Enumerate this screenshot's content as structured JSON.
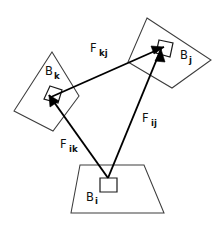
{
  "figure": {
    "background_color": "#ffffff",
    "line_color": "#3d3d3d",
    "arrow_color": "#000000",
    "text_color": "#111111",
    "width": 219,
    "height": 229
  },
  "bodies": [
    {
      "id": "B_i",
      "label_base": "B",
      "label_sub": "i",
      "shape": "trapezoid",
      "label_x": 86,
      "label_y": 201,
      "sub_x": 95,
      "sub_y": 204,
      "outline_points": "80,165 144,165 164,213 71,213",
      "anchor_shape": "square",
      "anchor_points": "100,178 117,178 117,192 100,192"
    },
    {
      "id": "B_j",
      "label_base": "B",
      "label_sub": "j",
      "shape": "quadrilateral",
      "label_x": 180,
      "label_y": 59,
      "sub_x": 189,
      "sub_y": 63,
      "outline_points": "147,18 211,60 172,88 128,62",
      "anchor_shape": "rotated-square",
      "anchor_points": "159,40 173,43 170,57 156,53"
    },
    {
      "id": "B_k",
      "label_base": "B",
      "label_sub": "k",
      "shape": "quadrilateral",
      "label_x": 45,
      "label_y": 75,
      "sub_x": 54,
      "sub_y": 79,
      "outline_points": "52,52 79,96 53,131 14,111",
      "anchor_shape": "rotated-square",
      "anchor_points": "50,86 62,90 58,103 44,99"
    }
  ],
  "forces": [
    {
      "id": "F_kj",
      "label_base": "F",
      "label_sub": "kj",
      "from_body": "B_k",
      "to_body": "B_j",
      "x1": 51,
      "y1": 97,
      "x2": 164,
      "y2": 47,
      "label_x": 90,
      "label_y": 52,
      "sub_x": 99,
      "sub_y": 56,
      "head_points": "164,47 151,46 154,54"
    },
    {
      "id": "F_ij",
      "label_base": "F",
      "label_sub": "ij",
      "from_body": "B_i",
      "to_body": "B_j",
      "x1": 108,
      "y1": 178,
      "x2": 161,
      "y2": 49,
      "label_x": 142,
      "label_y": 122,
      "sub_x": 151,
      "sub_y": 126,
      "head_points": "161,49 155,61 165,62"
    },
    {
      "id": "F_ik",
      "label_base": "F",
      "label_sub": "ik",
      "from_body": "B_i",
      "to_body": "B_k",
      "x1": 108,
      "y1": 178,
      "x2": 49,
      "y2": 95,
      "label_x": 60,
      "label_y": 148,
      "sub_x": 69,
      "sub_y": 152,
      "head_points": "49,95 50,107 59,101"
    }
  ]
}
